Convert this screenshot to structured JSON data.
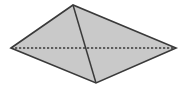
{
  "figure": {
    "name": "quadrilateral-with-diagonals",
    "canvas": {
      "width": 185,
      "height": 90
    },
    "colors": {
      "background": "#ffffff",
      "fill": "#c9c9c9",
      "stroke": "#3a3a3a",
      "dashed_stroke": "#3a3a3a"
    },
    "style": {
      "outline_width": 1.6,
      "solid_diagonal_width": 1.5,
      "dashed_diagonal_width": 1.5,
      "dash_pattern": "2.2 1.8"
    },
    "vertices": [
      {
        "label": "left",
        "x": 11,
        "y": 48
      },
      {
        "label": "top",
        "x": 73,
        "y": 5
      },
      {
        "label": "right",
        "x": 176,
        "y": 48
      },
      {
        "label": "bottom",
        "x": 96,
        "y": 83
      }
    ],
    "outline_path": "M 11 48 L 73 5 L 176 48 L 96 83 Z",
    "solid_diagonal": {
      "name": "diagonal-top-bottom",
      "x1": 73,
      "y1": 5,
      "x2": 96,
      "y2": 83
    },
    "dashed_diagonal": {
      "name": "diagonal-left-right",
      "x1": 11,
      "y1": 48,
      "x2": 176,
      "y2": 48
    }
  }
}
